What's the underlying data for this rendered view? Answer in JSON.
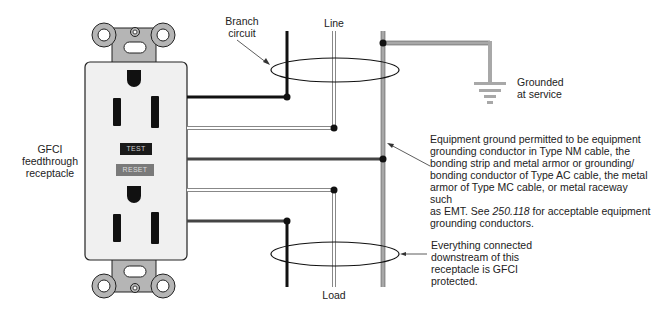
{
  "diagram": {
    "labels": {
      "branch_circuit_line1": "Branch",
      "branch_circuit_line2": "circuit",
      "line": "Line",
      "load": "Load",
      "grounded_line1": "Grounded",
      "grounded_line2": "at service",
      "gfci_line1": "GFCI",
      "gfci_line2": "feedthrough",
      "gfci_line3": "receptacle"
    },
    "receptacle": {
      "test_button": "TEST",
      "reset_button": "RESET"
    },
    "equipment_ground_note": {
      "line1": "Equipment ground permitted to be equipment",
      "line2": "grounding conductor in Type NM cable, the",
      "line3": "bonding strip and metal armor or grounding/",
      "line4": "bonding conductor of Type AC cable, the metal",
      "line5": "armor of Type MC cable, or metal raceway such",
      "line6_pre": "as EMT. See ",
      "line6_ref": "250.118",
      "line6_post": " for acceptable equipment",
      "line7": "grounding conductors."
    },
    "downstream_note": {
      "line1": "Everything connected",
      "line2": "downstream of this",
      "line3": "receptacle is GFCI",
      "line4": "protected."
    },
    "colors": {
      "hot": "#111111",
      "neutral_fill": "#ffffff",
      "neutral_outline": "#888888",
      "ground": "#a8a8a8",
      "receptacle_body": "#f0f0f0",
      "yoke": "#b5b5b5",
      "test_bg": "#1a1a1a",
      "reset_bg": "#7a7a7a"
    }
  }
}
